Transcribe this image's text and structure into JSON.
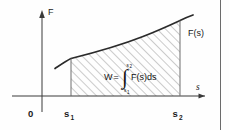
{
  "figure": {
    "name": "work-as-area-under-force-curve",
    "background_color": "#fefefe",
    "stroke_color": "#3a3a3a",
    "hatch_color": "#8a8a8a"
  },
  "axes": {
    "vertical_label": "F",
    "horizontal_label": "s",
    "origin_label": "0"
  },
  "ticks": {
    "lower_limit_base": "s",
    "lower_limit_sub": "1",
    "upper_limit_base": "s",
    "upper_limit_sub": "2"
  },
  "curve": {
    "label": "F(s)",
    "shape": "increasing-concave-up"
  },
  "region": {
    "formula_lhs": "W",
    "formula_equals": "=",
    "integral_symbol": "∫",
    "integral_upper_base": "s",
    "integral_upper_sub": "2",
    "integral_lower_base": "s",
    "integral_lower_sub": "1",
    "integrand": "F(s)ds",
    "fill": "diagonal-hatch"
  },
  "border": {
    "right_rule": true
  }
}
